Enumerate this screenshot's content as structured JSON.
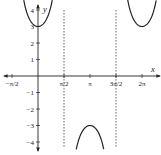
{
  "chart_data": {
    "type": "line",
    "title": "",
    "function": "y = 3 sec x",
    "xlabel": "x",
    "ylabel": "y",
    "xlim": [
      -1.5708,
      4.9
    ],
    "ylim": [
      -4.7,
      4.6
    ],
    "grid": false,
    "legend": null,
    "x_ticks": [
      {
        "value": -1.5708,
        "label": "−π/2"
      },
      {
        "value": 1.5708,
        "label": "π/2"
      },
      {
        "value": 3.1416,
        "label": "π"
      },
      {
        "value": 4.7124,
        "label": "3π/2"
      },
      {
        "value": 6.2832,
        "label": "2π"
      }
    ],
    "y_ticks": [
      {
        "value": 1,
        "label": "1"
      },
      {
        "value": 2,
        "label": "2"
      },
      {
        "value": 3,
        "label": "3"
      },
      {
        "value": 4,
        "label": "4"
      },
      {
        "value": -1,
        "label": "−1"
      },
      {
        "value": -2,
        "label": "−2"
      },
      {
        "value": -3,
        "label": "−3"
      },
      {
        "value": -4,
        "label": "−4"
      }
    ],
    "asymptotes": [
      {
        "x": 1.5708,
        "label": "x = π/2",
        "style": "dashed"
      },
      {
        "x": 4.7124,
        "label": "x = 3π/2",
        "style": "dashed"
      }
    ],
    "series": [
      {
        "name": "branch-1",
        "x_range": [
          -0.86,
          0.86
        ],
        "vertex": [
          0,
          3
        ]
      },
      {
        "name": "branch-2",
        "x_range": [
          2.31,
          3.97
        ],
        "vertex": [
          3.1416,
          -3
        ]
      },
      {
        "name": "branch-3",
        "x_range": [
          5.42,
          7.14
        ],
        "vertex": [
          6.2832,
          3
        ]
      }
    ],
    "amplitude": 3,
    "key_points": [
      {
        "x": 0,
        "y": 3
      },
      {
        "x": 3.1416,
        "y": -3
      },
      {
        "x": 6.2832,
        "y": 3
      }
    ]
  },
  "labels": {
    "x_axis": "x",
    "y_axis": "y"
  }
}
